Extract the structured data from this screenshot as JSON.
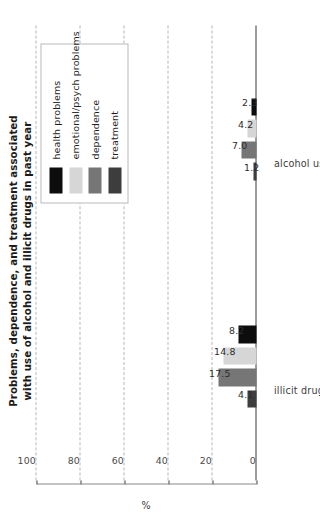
{
  "chart_data": {
    "type": "bar",
    "orientation": "horizontal-grouped",
    "title": "Problems, dependence, and treatment associated with use of alcohol and illicit drugs in past year",
    "title_lines": [
      "Problems, dependence, and treatment associated",
      "with use of alcohol and illicit drugs in past year"
    ],
    "xlabel": "",
    "ylabel": "%",
    "ylim": [
      0,
      100
    ],
    "tick_labels": [
      "0",
      "20",
      "40",
      "60",
      "80",
      "100"
    ],
    "tick_values": [
      0,
      20,
      40,
      60,
      80,
      100
    ],
    "grid": true,
    "grid_style": "dashed",
    "legend_position": "upper-right",
    "categories": [
      "alcohol use",
      "illicit drug use"
    ],
    "series": [
      {
        "name": "health problems",
        "color": "#0d0d0d",
        "values": [
          2.3,
          8.2
        ],
        "labels": [
          "2.3",
          "8.2"
        ]
      },
      {
        "name": "emotional/psych problems",
        "color": "#d6d6d6",
        "values": [
          4.2,
          14.8
        ],
        "labels": [
          "4.2",
          "14.8"
        ]
      },
      {
        "name": "dependence",
        "color": "#767676",
        "values": [
          7.0,
          17.5
        ],
        "labels": [
          "7.0",
          "17.5"
        ]
      },
      {
        "name": "treatment",
        "color": "#3d3d3d",
        "values": [
          1.2,
          4.1
        ],
        "labels": [
          "1.2",
          "4.1"
        ]
      }
    ]
  },
  "legend": {
    "items": [
      {
        "label": "health problems",
        "color": "#0d0d0d"
      },
      {
        "label": "emotional/psych problems",
        "color": "#d6d6d6"
      },
      {
        "label": "dependence",
        "color": "#767676"
      },
      {
        "label": "treatment",
        "color": "#3d3d3d"
      }
    ]
  },
  "axis": {
    "value_axis_title": "%",
    "value_ticks": [
      "0",
      "20",
      "40",
      "60",
      "80",
      "100"
    ],
    "category_labels": [
      "alcohol use",
      "illicit drug use"
    ]
  },
  "colors": {
    "background": "#ffffff",
    "axis_line": "#3b3b3b",
    "gridline": "#b5b5b5",
    "title_text": "#1a1a1a",
    "tick_text": "#4a4a4a",
    "legend_border": "#b9b9b9"
  }
}
